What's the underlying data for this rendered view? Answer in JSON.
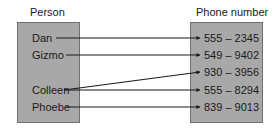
{
  "diagram": {
    "left_set": {
      "title": "Person",
      "items": [
        "Dan",
        "Gizmo",
        "Colleen",
        "Phoebe"
      ]
    },
    "right_set": {
      "title": "Phone number",
      "items": [
        "555 – 2345",
        "549 – 9402",
        "930 – 3956",
        "555 – 8294",
        "839 – 9013"
      ]
    },
    "mappings": [
      {
        "from": "Dan",
        "to": "555 – 2345"
      },
      {
        "from": "Gizmo",
        "to": "549 – 9402"
      },
      {
        "from": "Colleen",
        "to": "930 – 3956"
      },
      {
        "from": "Colleen",
        "to": "555 – 8294"
      },
      {
        "from": "Phoebe",
        "to": "839 – 9013"
      }
    ],
    "colors": {
      "box_fill": "#a8a8a8",
      "box_border": "#6f6f6f",
      "arrow": "#1a1a1a",
      "text": "#1a1a1a"
    }
  }
}
